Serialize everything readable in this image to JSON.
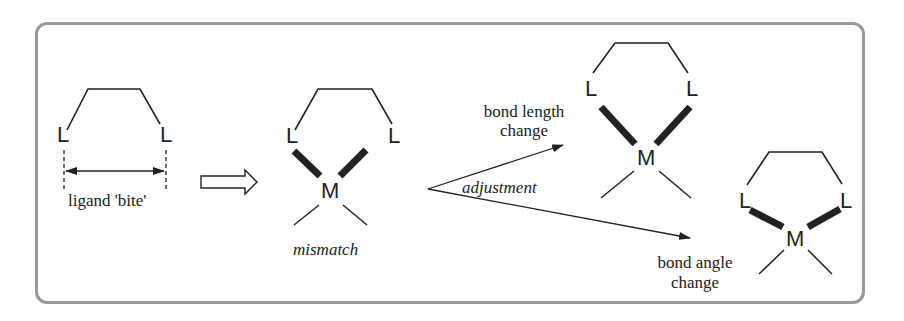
{
  "diagram": {
    "type": "chelate ligand bite mismatch scheme",
    "panel1": {
      "ligand_atoms": [
        "L",
        "L"
      ],
      "caption": "ligand 'bite'"
    },
    "transition_arrow": "hollow-right-arrow",
    "panel2": {
      "ligand_atoms": [
        "L",
        "L"
      ],
      "metal": "M",
      "caption": "mismatch"
    },
    "branch_label": "adjustment",
    "panel3": {
      "ligand_atoms": [
        "L",
        "L"
      ],
      "metal": "M",
      "caption_line1": "bond length",
      "caption_line2": "change"
    },
    "panel4": {
      "ligand_atoms": [
        "L",
        "L"
      ],
      "metal": "M",
      "caption_line1": "bond angle",
      "caption_line2": "change"
    },
    "colors": {
      "ink": "#222222",
      "frame": "#9a9a9a"
    }
  }
}
